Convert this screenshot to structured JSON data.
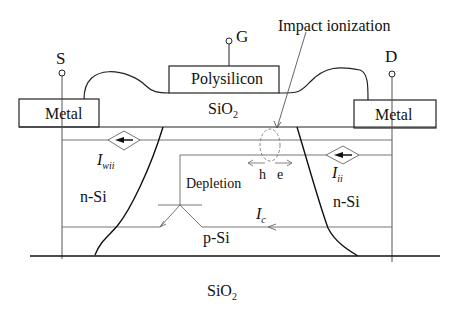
{
  "diagram": {
    "terminals": {
      "source": "S",
      "gate": "G",
      "drain": "D"
    },
    "gate_label": "Polysilicon",
    "gate_oxide_label": "SiO",
    "gate_oxide_sub": "2",
    "source_metal_label": "Metal",
    "drain_metal_label": "Metal",
    "annotation": "Impact ionization",
    "source_region_label": "n-Si",
    "drain_region_label": "n-Si",
    "body_label": "p-Si",
    "depletion_label": "Depletion",
    "hole_label": "h",
    "electron_label": "e",
    "current_wii": {
      "main": "I",
      "sub": "wii"
    },
    "current_ii": {
      "main": "I",
      "sub": "ii"
    },
    "current_c": {
      "main": "I",
      "sub": "c"
    },
    "buried_oxide_label": "SiO",
    "buried_oxide_sub": "2"
  }
}
